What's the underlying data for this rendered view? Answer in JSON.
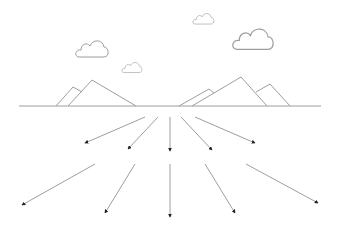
{
  "illustration": {
    "description": "Line-art landscape with mountains, clouds on a horizon and ten arrows radiating downward from a central point",
    "colors": {
      "background": "#ffffff",
      "line": "#9e9e9e",
      "arrowhead": "#222222"
    },
    "horizon": {
      "x1": 19,
      "x2": 321,
      "y": 106
    },
    "mountains": [
      {
        "name": "left-back",
        "points": "56,106 73,87 82,92"
      },
      {
        "name": "left-front",
        "points": "68,106 92,80 136,106"
      },
      {
        "name": "right-back",
        "points": "179,106 209,89 214,93"
      },
      {
        "name": "right-front",
        "points": "192,106 241,77 267,106"
      },
      {
        "name": "right-small",
        "points": "256,92 270,84 290,106"
      }
    ],
    "clouds": [
      {
        "name": "cloud-left-large",
        "x": 76,
        "y": 40,
        "scale": 1.0
      },
      {
        "name": "cloud-left-small",
        "x": 122,
        "y": 62,
        "scale": 0.62
      },
      {
        "name": "cloud-top-small",
        "x": 193,
        "y": 13,
        "scale": 0.65
      },
      {
        "name": "cloud-right-large",
        "x": 233,
        "y": 28,
        "scale": 1.25
      }
    ],
    "arrows": [
      {
        "x1": 145,
        "y1": 117,
        "x2": 85,
        "y2": 143
      },
      {
        "x1": 158,
        "y1": 117,
        "x2": 128,
        "y2": 149
      },
      {
        "x1": 170,
        "y1": 117,
        "x2": 170,
        "y2": 151
      },
      {
        "x1": 181,
        "y1": 117,
        "x2": 212,
        "y2": 150
      },
      {
        "x1": 195,
        "y1": 117,
        "x2": 255,
        "y2": 143
      },
      {
        "x1": 95,
        "y1": 164,
        "x2": 22,
        "y2": 205
      },
      {
        "x1": 135,
        "y1": 164,
        "x2": 105,
        "y2": 213
      },
      {
        "x1": 170,
        "y1": 164,
        "x2": 170,
        "y2": 217
      },
      {
        "x1": 205,
        "y1": 164,
        "x2": 235,
        "y2": 213
      },
      {
        "x1": 246,
        "y1": 164,
        "x2": 318,
        "y2": 203
      }
    ]
  }
}
